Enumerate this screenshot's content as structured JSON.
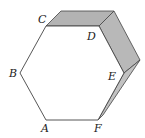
{
  "diagram": {
    "type": "hexagonal-prism",
    "labels": {
      "A": "A",
      "B": "B",
      "C": "C",
      "D": "D",
      "E": "E",
      "F": "F"
    },
    "colors": {
      "stroke": "#444444",
      "face": "#ffffff",
      "side_shade": "#b3b3b3"
    }
  }
}
